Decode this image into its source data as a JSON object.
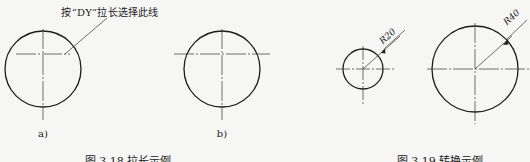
{
  "figure_left": {
    "annotation": "按“DY”拉长选择此线",
    "subfigures": [
      {
        "label": "a)",
        "cx": 43,
        "cy": 69,
        "r": 38
      },
      {
        "label": "b)",
        "cx": 222,
        "cy": 69,
        "r": 38
      }
    ],
    "caption": "图 3.18   拉长示例"
  },
  "figure_right": {
    "circles": [
      {
        "dimension": "R20",
        "cx": 363,
        "cy": 69,
        "r": 20
      },
      {
        "dimension": "R40",
        "cx": 475,
        "cy": 69,
        "r": 43
      }
    ],
    "caption": "图 3.19   转换示例"
  },
  "colors": {
    "line": "#1c1c1c",
    "centerline": "#333333",
    "background": "#f6f6f4"
  }
}
